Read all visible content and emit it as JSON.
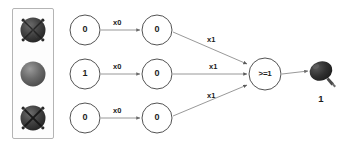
{
  "diagram": {
    "type": "perceptron-logic-network",
    "background_color": "#ffffff",
    "stroke_color": "#4a4a4a",
    "text_color": "#1a1a1a"
  },
  "sensor_panel": {
    "name": "sensor-panel",
    "border_color": "#b0b0b0",
    "fill_color": "#fdfdfd",
    "sensors": [
      {
        "id": "sensor-1",
        "icon": "sphere-spoked-icon",
        "state": "dark-textured",
        "color": "#3b3b3b"
      },
      {
        "id": "sensor-2",
        "icon": "sphere-plain-icon",
        "state": "plain-gray",
        "color": "#666666"
      },
      {
        "id": "sensor-3",
        "icon": "sphere-crossed-icon",
        "state": "dark-crossed",
        "color": "#3b3b3b"
      }
    ]
  },
  "input_nodes": [
    {
      "id": "input-node-1",
      "value": "0"
    },
    {
      "id": "input-node-2",
      "value": "1"
    },
    {
      "id": "input-node-3",
      "value": "0"
    }
  ],
  "input_weights": [
    {
      "id": "weight-input-1",
      "label": "x0"
    },
    {
      "id": "weight-input-2",
      "label": "x0"
    },
    {
      "id": "weight-input-3",
      "label": "x0"
    }
  ],
  "hidden_nodes": [
    {
      "id": "hidden-node-1",
      "value": "0"
    },
    {
      "id": "hidden-node-2",
      "value": "0"
    },
    {
      "id": "hidden-node-3",
      "value": "0"
    }
  ],
  "hidden_weights": [
    {
      "id": "weight-hidden-1",
      "label": "x1"
    },
    {
      "id": "weight-hidden-2",
      "label": "x1"
    },
    {
      "id": "weight-hidden-3",
      "label": "x1"
    }
  ],
  "threshold_node": {
    "id": "threshold-node",
    "label": ">=1"
  },
  "output": {
    "id": "output-indicator",
    "icon": "balloon-bulb-icon",
    "color": "#2e2e2e",
    "value": "1"
  }
}
